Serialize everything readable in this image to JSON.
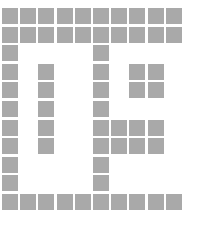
{
  "figure": {
    "name": "grid-pattern",
    "type": "binary-cell-grid",
    "width_px": 201,
    "height_px": 226,
    "background_color": "#ffffff",
    "filled_color": "#a9a9a9",
    "empty_color": "#ffffff",
    "columns": 10,
    "rows": 11,
    "origin_x_px": 2,
    "origin_y_px": 8,
    "cell_width_px": 16,
    "cell_height_px": 16,
    "gap_x_px": 2.2,
    "gap_y_px": 2.6
  },
  "chart_data": {
    "type": "heatmap",
    "title": "",
    "xlabel": "",
    "ylabel": "",
    "categories": [
      "c0",
      "c1",
      "c2",
      "c3",
      "c4",
      "c5",
      "c6",
      "c7",
      "c8",
      "c9"
    ],
    "row_labels": [
      "r0",
      "r1",
      "r2",
      "r3",
      "r4",
      "r5",
      "r6",
      "r7",
      "r8",
      "r9",
      "r10"
    ],
    "value_legend": {
      "1": "filled",
      "0": "empty"
    },
    "grid": [
      [
        1,
        1,
        1,
        1,
        1,
        1,
        1,
        1,
        1,
        1
      ],
      [
        1,
        1,
        1,
        1,
        1,
        1,
        1,
        1,
        1,
        1
      ],
      [
        1,
        0,
        0,
        0,
        0,
        1,
        0,
        0,
        0,
        0
      ],
      [
        1,
        0,
        1,
        0,
        0,
        1,
        0,
        1,
        1,
        0
      ],
      [
        1,
        0,
        1,
        0,
        0,
        1,
        0,
        1,
        1,
        0
      ],
      [
        1,
        0,
        1,
        0,
        0,
        1,
        0,
        0,
        0,
        0
      ],
      [
        1,
        0,
        1,
        0,
        0,
        1,
        1,
        1,
        1,
        0
      ],
      [
        1,
        0,
        1,
        0,
        0,
        1,
        1,
        1,
        1,
        0
      ],
      [
        1,
        0,
        0,
        0,
        0,
        1,
        0,
        0,
        0,
        0
      ],
      [
        1,
        0,
        0,
        0,
        0,
        1,
        0,
        0,
        0,
        0
      ],
      [
        1,
        1,
        1,
        1,
        1,
        1,
        1,
        1,
        1,
        1
      ]
    ]
  }
}
